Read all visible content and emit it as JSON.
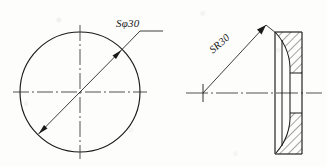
{
  "drawing": {
    "title": "Spherical cap two-view engineering drawing",
    "background_color": "#fdfdfc",
    "line_color": "#1a1a1a",
    "center_line_color": "#333333",
    "views": [
      {
        "id": "front-view",
        "name": "front view circular",
        "center": [
          80,
          92
        ],
        "radius": 60,
        "dimension": {
          "label": "Sφ30",
          "type": "spherical-diameter",
          "value": 30,
          "prefix": "S⌀",
          "arrow_ends": "both"
        }
      },
      {
        "id": "section-view",
        "name": "sectioned side view",
        "dimension": {
          "label": "SR30",
          "type": "spherical-radius",
          "value": 30,
          "prefix": "SR",
          "arrow_ends": "one"
        },
        "hatch_angle_deg": 45,
        "center_origin": [
          203,
          93
        ]
      }
    ],
    "labels": {
      "sphere_diameter": "Sφ30",
      "sphere_radius": "SR30"
    }
  }
}
